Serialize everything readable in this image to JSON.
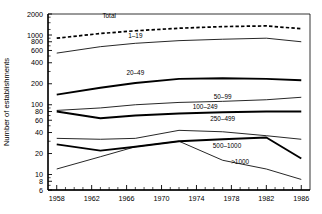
{
  "chart_data": {
    "type": "line",
    "title": "",
    "xlabel": "",
    "ylabel": "Number of establishments",
    "yscale": "log",
    "ylim": [
      6,
      2000
    ],
    "xlim": [
      1957,
      1987
    ],
    "grid": false,
    "legend_position": "inline-labels",
    "ytick_labels": [
      "2000",
      "1000",
      "800",
      "600",
      "400",
      "200",
      "100",
      "80",
      "60",
      "40",
      "20",
      "10",
      "8",
      "6"
    ],
    "ytick_values": [
      2000,
      1000,
      800,
      600,
      400,
      200,
      100,
      80,
      60,
      40,
      20,
      10,
      8,
      6
    ],
    "xtick_labels": [
      "1958",
      "1962",
      "1966",
      "1970",
      "1974",
      "1978",
      "1982",
      "1986"
    ],
    "xtick_values": [
      1958,
      1962,
      1966,
      1970,
      1974,
      1978,
      1982,
      1986
    ],
    "x": [
      1958,
      1963,
      1967,
      1972,
      1977,
      1982,
      1986
    ],
    "series": [
      {
        "name": "Total",
        "label": "Total",
        "style": "dashed",
        "values": [
          900,
          1050,
          1150,
          1250,
          1320,
          1350,
          1230
        ]
      },
      {
        "name": "1-19",
        "label": "1–19",
        "style": "thin",
        "values": [
          550,
          680,
          760,
          830,
          870,
          900,
          800
        ]
      },
      {
        "name": "20-49",
        "label": "20–49",
        "style": "thick",
        "values": [
          140,
          175,
          205,
          235,
          240,
          235,
          225
        ]
      },
      {
        "name": "50-99",
        "label": "50–99",
        "style": "thin",
        "values": [
          83,
          90,
          100,
          108,
          112,
          118,
          128
        ]
      },
      {
        "name": "100-249",
        "label": "100–249",
        "style": "thick",
        "values": [
          80,
          64,
          70,
          75,
          78,
          80,
          80
        ]
      },
      {
        "name": "250-499",
        "label": "250–499",
        "style": "thin",
        "values": [
          33,
          32,
          33,
          43,
          41,
          36,
          32
        ]
      },
      {
        "name": "500-1000",
        "label": "500–1000",
        "style": "thick",
        "values": [
          27,
          22,
          25,
          30,
          32,
          34,
          17
        ]
      },
      {
        "name": ">1000",
        "label": "&gt;1000",
        "style": "thin",
        "values": [
          12,
          18,
          25,
          30,
          16,
          12,
          8.5
        ]
      }
    ],
    "series_label_positions": [
      {
        "name": "Total",
        "x": 1964.0,
        "y": 1780
      },
      {
        "name": "1-19",
        "x": 1967.0,
        "y": 900
      },
      {
        "name": "20-49",
        "x": 1967.0,
        "y": 270
      },
      {
        "name": "50-99",
        "x": 1977.0,
        "y": 120
      },
      {
        "name": "100-249",
        "x": 1975.0,
        "y": 88
      },
      {
        "name": "250-499",
        "x": 1977.0,
        "y": 58
      },
      {
        "name": "500-1000",
        "x": 1977.5,
        "y": 24
      },
      {
        "name": ">1000",
        "x": 1979.0,
        "y": 14
      }
    ]
  }
}
